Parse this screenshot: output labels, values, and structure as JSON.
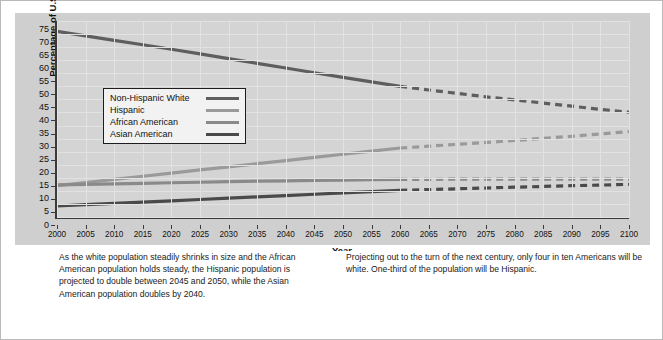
{
  "chart_data": {
    "type": "line",
    "title": "",
    "xlabel": "Year",
    "ylabel": "Percentage of U.S. Population",
    "xlim": [
      2000,
      2100
    ],
    "ylim": [
      0,
      75
    ],
    "y_ticks": [
      0,
      5,
      10,
      15,
      20,
      25,
      30,
      35,
      40,
      45,
      50,
      55,
      60,
      65,
      70,
      75
    ],
    "x_ticks": [
      2000,
      2005,
      2010,
      2015,
      2020,
      2025,
      2030,
      2035,
      2040,
      2045,
      2050,
      2055,
      2060,
      2065,
      2070,
      2075,
      2080,
      2085,
      2090,
      2095,
      2100
    ],
    "grid": true,
    "legend_position": "upper-left-inside",
    "projection_starts": 2060,
    "x": [
      2000,
      2005,
      2010,
      2015,
      2020,
      2025,
      2030,
      2035,
      2040,
      2045,
      2050,
      2055,
      2060,
      2065,
      2070,
      2075,
      2080,
      2085,
      2090,
      2095,
      2100
    ],
    "series": [
      {
        "name": "Non-Hispanic White",
        "color": "#5e5e5e",
        "values": [
          71.0,
          69.3,
          67.6,
          65.9,
          64.2,
          62.4,
          60.6,
          58.8,
          57.0,
          55.2,
          53.4,
          51.7,
          50.0,
          48.6,
          47.3,
          46.0,
          44.8,
          43.6,
          42.4,
          41.2,
          40.1
        ]
      },
      {
        "name": "Hispanic",
        "color": "#9a9a9a",
        "values": [
          12.0,
          13.2,
          14.4,
          15.6,
          16.8,
          18.0,
          19.2,
          20.4,
          21.6,
          22.8,
          24.0,
          25.2,
          26.4,
          27.1,
          27.8,
          28.5,
          29.3,
          30.1,
          30.9,
          31.8,
          32.7
        ]
      },
      {
        "name": "African American",
        "color": "#8a8a8a",
        "values": [
          12.3,
          12.5,
          12.7,
          12.9,
          13.1,
          13.3,
          13.5,
          13.7,
          13.8,
          14.0,
          14.1,
          14.3,
          14.4,
          14.4,
          14.5,
          14.5,
          14.5,
          14.5,
          14.5,
          14.5,
          14.5
        ]
      },
      {
        "name": "Asian American",
        "color": "#4a4a4a",
        "values": [
          4.2,
          4.7,
          5.2,
          5.7,
          6.2,
          6.7,
          7.2,
          7.7,
          8.2,
          8.7,
          9.2,
          9.7,
          10.2,
          10.5,
          10.8,
          11.1,
          11.4,
          11.7,
          12.0,
          12.2,
          12.5
        ]
      }
    ]
  },
  "captions": {
    "left": "As the white population steadily shrinks in size and the African American population holds steady, the Hispanic population is projected to double between 2045 and 2050, while the Asian American population doubles by 2040.",
    "right": "Projecting out to the turn of the next century, only four in ten Americans will be white. One-third of the population will be Hispanic."
  },
  "colors": {
    "panel_background": "#cfcfcf",
    "plot_background": "#d4d4d4",
    "gridline": "#e2e2e2",
    "axis": "#3a3a3a",
    "page_background": "#ffffff",
    "frame_border": "#b9b9b9"
  }
}
